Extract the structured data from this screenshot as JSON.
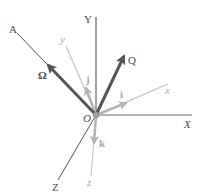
{
  "diagram": {
    "origin_label": "O",
    "fixed_axes": [
      {
        "id": "Y",
        "label": "Y"
      },
      {
        "id": "X",
        "label": "X"
      },
      {
        "id": "Z",
        "label": "Z"
      },
      {
        "id": "A",
        "label": "A"
      }
    ],
    "rotating_axes": [
      {
        "id": "y",
        "label": "y"
      },
      {
        "id": "x",
        "label": "x"
      },
      {
        "id": "z",
        "label": "z"
      }
    ],
    "unit_vectors": [
      {
        "id": "i",
        "label": "i"
      },
      {
        "id": "j",
        "label": "j"
      },
      {
        "id": "k",
        "label": "k"
      }
    ],
    "vectors": [
      {
        "id": "Omega",
        "label": "Ω"
      },
      {
        "id": "Q",
        "label": "Q"
      }
    ],
    "colors": {
      "dark": "#555555",
      "light": "#b5b5b5",
      "origin_dot": "#9a9a9a"
    }
  }
}
